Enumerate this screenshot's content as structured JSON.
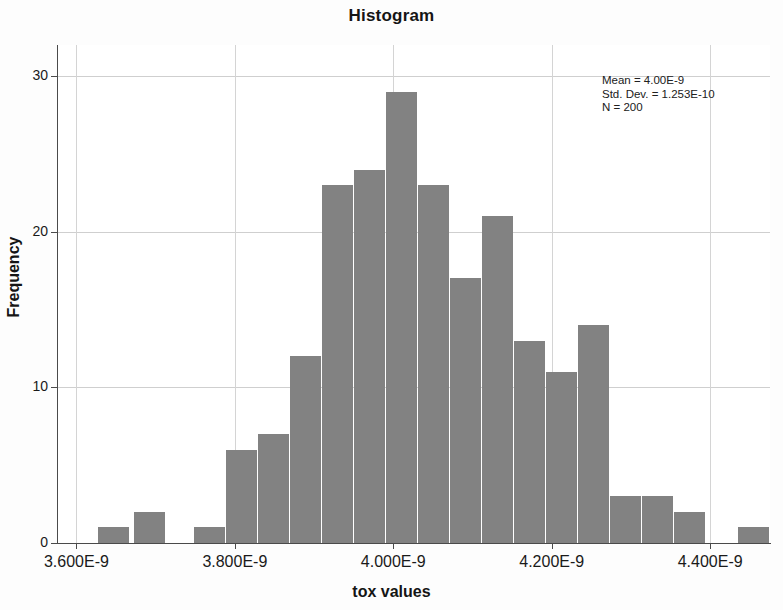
{
  "chart_data": {
    "type": "bar",
    "title": "Histogram",
    "xlabel": "tox values",
    "ylabel": "Frequency",
    "xtick_labels": [
      "3.600E-9",
      "3.800E-9",
      "4.000E-9",
      "4.200E-9",
      "4.400E-9"
    ],
    "xtick_values": [
      3.6e-09,
      3.8e-09,
      4e-09,
      4.2e-09,
      4.4e-09
    ],
    "ytick_labels": [
      "0",
      "10",
      "20",
      "30"
    ],
    "ytick_values": [
      0,
      10,
      20,
      30
    ],
    "ylim": [
      0,
      32
    ],
    "xlim": [
      3.5755e-09,
      4.4755e-09
    ],
    "grid": true,
    "legend": null,
    "bar_color": "#828282",
    "bin_width": 2.5e-11,
    "categories": [
      "3.613E-9",
      "3.638E-9",
      "3.663E-9",
      "3.688E-9",
      "3.713E-9",
      "3.738E-9",
      "3.763E-9",
      "3.788E-9",
      "3.813E-9",
      "3.838E-9",
      "3.863E-9",
      "3.888E-9",
      "3.913E-9",
      "3.938E-9",
      "3.963E-9",
      "3.988E-9",
      "4.013E-9",
      "4.038E-9",
      "4.063E-9",
      "4.088E-9",
      "4.113E-9",
      "4.138E-9",
      "4.163E-9",
      "4.188E-9",
      "4.213E-9",
      "4.238E-9",
      "4.263E-9",
      "4.288E-9",
      "4.313E-9",
      "4.338E-9",
      "4.363E-9",
      "4.388E-9",
      "4.413E-9",
      "4.438E-9"
    ],
    "values": [
      0,
      1,
      2,
      0,
      0,
      0,
      1,
      6,
      7,
      12,
      23,
      24,
      29,
      23,
      17,
      21,
      13,
      11,
      14,
      3,
      3,
      2,
      0,
      1,
      0,
      0,
      0,
      0,
      0,
      0,
      0,
      0,
      0,
      0
    ],
    "bars": [
      {
        "index": 1,
        "x": "3.638E-9",
        "value": 1,
        "px_left": 98,
        "px_width": 31
      },
      {
        "index": 2,
        "x": "3.663E-9",
        "value": 2,
        "px_left": 134,
        "px_width": 31
      },
      {
        "index": 6,
        "x": "3.763E-9",
        "value": 1,
        "px_left": 194,
        "px_width": 31
      },
      {
        "index": 7,
        "x": "3.788E-9",
        "value": 6,
        "px_left": 226,
        "px_width": 31
      },
      {
        "index": 8,
        "x": "3.813E-9",
        "value": 7,
        "px_left": 258,
        "px_width": 31
      },
      {
        "index": 9,
        "x": "3.838E-9",
        "value": 12,
        "px_left": 290,
        "px_width": 31
      },
      {
        "index": 10,
        "x": "3.863E-9",
        "value": 23,
        "px_left": 322,
        "px_width": 31
      },
      {
        "index": 11,
        "x": "3.888E-9",
        "value": 24,
        "px_left": 354,
        "px_width": 31
      },
      {
        "index": 12,
        "x": "3.913E-9",
        "value": 29,
        "px_left": 386,
        "px_width": 31
      },
      {
        "index": 13,
        "x": "3.938E-9",
        "value": 23,
        "px_left": 418,
        "px_width": 31
      },
      {
        "index": 14,
        "x": "3.963E-9",
        "value": 17,
        "px_left": 450,
        "px_width": 31
      },
      {
        "index": 15,
        "x": "3.988E-9",
        "value": 21,
        "px_left": 482,
        "px_width": 31
      },
      {
        "index": 16,
        "x": "4.013E-9",
        "value": 13,
        "px_left": 514,
        "px_width": 31
      },
      {
        "index": 17,
        "x": "4.038E-9",
        "value": 11,
        "px_left": 546,
        "px_width": 31
      },
      {
        "index": 18,
        "x": "4.063E-9",
        "value": 14,
        "px_left": 578,
        "px_width": 31
      },
      {
        "index": 19,
        "x": "4.088E-9",
        "value": 3,
        "px_left": 610,
        "px_width": 31
      },
      {
        "index": 20,
        "x": "4.113E-9",
        "value": 3,
        "px_left": 642,
        "px_width": 31
      },
      {
        "index": 21,
        "x": "4.138E-9",
        "value": 2,
        "px_left": 674,
        "px_width": 31
      },
      {
        "index": 23,
        "x": "4.188E-9",
        "value": 1,
        "px_left": 738,
        "px_width": 31
      }
    ],
    "annotations": {
      "mean_label": "Mean = 4.00E-9",
      "stddev_label": "Std. Dev. = 1.253E-10",
      "n_label": "N = 200",
      "mean": 4e-09,
      "std_dev": 1.253e-10,
      "n": 200
    }
  }
}
